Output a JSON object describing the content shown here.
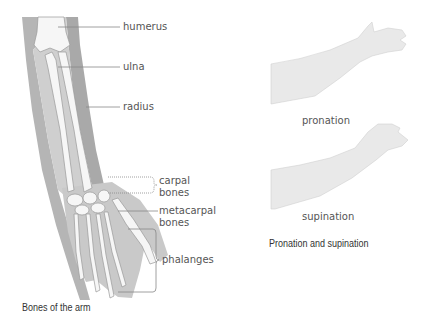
{
  "arm_bones": {
    "caption": "Bones of the arm",
    "labels": {
      "humerus": "humerus",
      "ulna": "ulna",
      "radius": "radius",
      "carpal_1": "carpal",
      "carpal_2": "bones",
      "metacarpal_1": "metacarpal",
      "metacarpal_2": "bones",
      "phalanges": "phalanges"
    }
  },
  "rotation": {
    "caption": "Pronation and supination",
    "pronation": "pronation",
    "supination": "supination"
  },
  "colors": {
    "skin": "#c8c8c8",
    "skin_dark": "#a8a8a8",
    "bone": "#f4f4f4",
    "leader": "#888888",
    "forearm_fill": "#e6e6e6"
  }
}
